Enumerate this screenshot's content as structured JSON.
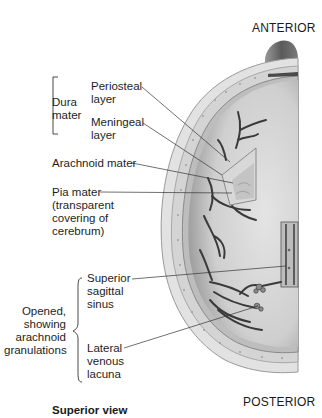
{
  "figure": {
    "view_caption": "Superior view",
    "orientation": {
      "top": "ANTERIOR",
      "bottom": "POSTERIOR"
    },
    "groups": [
      {
        "name": "Dura mater",
        "lines": [
          "Dura",
          "mater"
        ],
        "items": [
          "Periosteal layer",
          "Meningeal layer"
        ]
      },
      {
        "name": "Opened, showing arachnoid granulations",
        "lines": [
          "Opened,",
          "showing",
          "arachnoid",
          "granulations"
        ],
        "items": [
          "Superior sagittal sinus",
          "Lateral venous lacuna"
        ]
      }
    ],
    "labels": {
      "periosteal": [
        "Periosteal",
        "layer"
      ],
      "meningeal": [
        "Meningeal",
        "layer"
      ],
      "arachnoid": [
        "Arachnoid mater"
      ],
      "pia": [
        "Pia mater",
        "(transparent",
        "covering of",
        "cerebrum)"
      ],
      "sinus": [
        "Superior",
        "sagittal",
        "sinus"
      ],
      "lacuna": [
        "Lateral",
        "venous",
        "lacuna"
      ]
    },
    "colors": {
      "background": "#ffffff",
      "skull": "#d9d9d9",
      "brain": "#c9c9c9",
      "vessels": "#3a3a3a",
      "text": "#1e1e1e"
    }
  }
}
